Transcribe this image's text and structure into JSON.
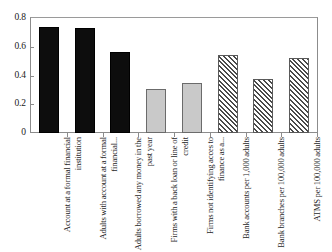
{
  "chart_data": {
    "type": "bar",
    "title": "",
    "xlabel": "",
    "ylabel": "",
    "ylim": [
      0,
      0.8
    ],
    "grid": false,
    "legend": "none",
    "y_ticks": [
      "0",
      "0.2",
      "0.4",
      "0.6",
      "0.8"
    ],
    "y_tick_values": [
      0,
      0.2,
      0.4,
      0.6,
      0.8
    ],
    "categories": [
      "Account at a formal financial institution",
      "Adults with account at a formal financial...",
      "Adults borrowed any money in the past year",
      "Firms with a back loan or line of credit",
      "Firms not identifying acces to finance as a...",
      "Bank accounts per 1,000 adults",
      "Bank branches per 100,000 adults",
      "ATMS per 100,000 adults"
    ],
    "values": [
      0.735,
      0.73,
      0.565,
      0.305,
      0.35,
      0.545,
      0.375,
      0.525
    ],
    "bar_styles": [
      "solid",
      "solid",
      "solid",
      "gray",
      "gray",
      "hatch",
      "hatch",
      "hatch"
    ],
    "colors": {
      "solid": "#0d0d0d",
      "gray": "#c9c9c9",
      "gray_border": "#6b6b6b",
      "hatch_fill": "#ffffff",
      "hatch_line": "#4a4a4a",
      "axis": "#8c8c8c",
      "text": "#1a1a1a",
      "background": "#ffffff"
    }
  }
}
